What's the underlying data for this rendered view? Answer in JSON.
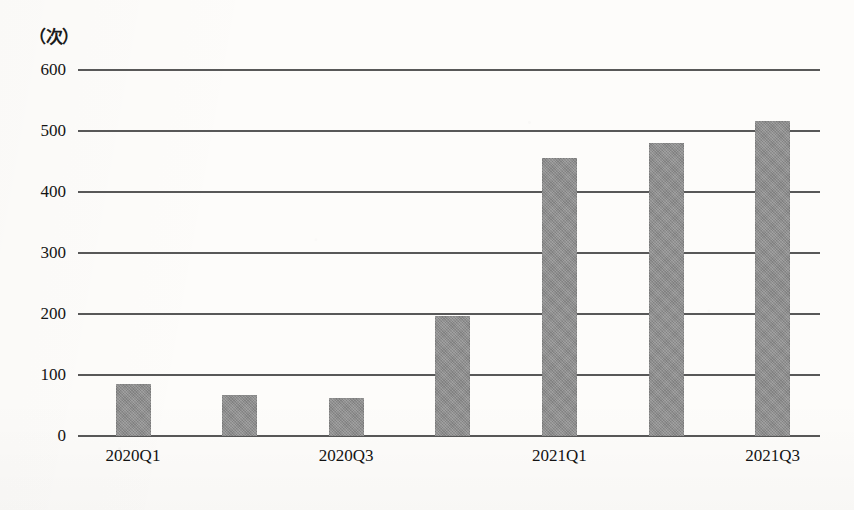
{
  "chart_data": {
    "type": "bar",
    "title": "",
    "subtitle": "",
    "xlabel": "",
    "ylabel": "（次）",
    "y_unit_label": "（次）",
    "categories": [
      "2020Q1",
      "2020Q2",
      "2020Q3",
      "2020Q4",
      "2021Q1",
      "2021Q2",
      "2021Q3"
    ],
    "visible_category_labels": [
      "2020Q1",
      "2020Q3",
      "2021Q1",
      "2021Q3"
    ],
    "values": [
      85,
      68,
      62,
      197,
      455,
      480,
      517
    ],
    "ylim": [
      0,
      600
    ],
    "ytick_labels": [
      "0",
      "100",
      "200",
      "300",
      "400",
      "500",
      "600"
    ],
    "ytick_values": [
      0,
      100,
      200,
      300,
      400,
      500,
      600
    ],
    "grid": true,
    "legend": "none",
    "bar_color": "#8d8d8d",
    "gridline_color": "#4b4b4b",
    "background_color": "#fdfcfa"
  },
  "axis": {
    "unit_label": "（次）"
  }
}
